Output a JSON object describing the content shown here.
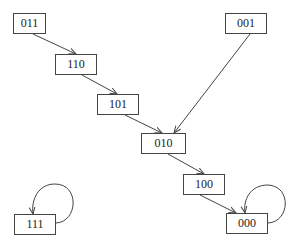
{
  "diagram": {
    "type": "state-transition-graph",
    "nodes": [
      {
        "id": "n011",
        "label": "011",
        "x": 13,
        "y": 13,
        "w": 33,
        "h": 21
      },
      {
        "id": "n110",
        "label": "110",
        "x": 55,
        "y": 54,
        "w": 42,
        "h": 21
      },
      {
        "id": "n101",
        "label": "101",
        "x": 97,
        "y": 94,
        "w": 42,
        "h": 21
      },
      {
        "id": "n001",
        "label": "001",
        "x": 225,
        "y": 13,
        "w": 42,
        "h": 21
      },
      {
        "id": "n010",
        "label": "010",
        "x": 141,
        "y": 133,
        "w": 45,
        "h": 21
      },
      {
        "id": "n100",
        "label": "100",
        "x": 183,
        "y": 174,
        "w": 42,
        "h": 21
      },
      {
        "id": "n000",
        "label": "000",
        "x": 226,
        "y": 213,
        "w": 42,
        "h": 21
      },
      {
        "id": "n111",
        "label": "111",
        "x": 14,
        "y": 214,
        "w": 42,
        "h": 21
      }
    ],
    "edges": [
      {
        "from": "011",
        "to": "110"
      },
      {
        "from": "110",
        "to": "101"
      },
      {
        "from": "101",
        "to": "010"
      },
      {
        "from": "001",
        "to": "010"
      },
      {
        "from": "010",
        "to": "100"
      },
      {
        "from": "100",
        "to": "000"
      },
      {
        "from": "000",
        "to": "000",
        "self_loop": true
      },
      {
        "from": "111",
        "to": "111",
        "self_loop": true
      }
    ],
    "colors": {
      "stroke": "#444444",
      "text": "#222222",
      "background": "#ffffff"
    }
  }
}
